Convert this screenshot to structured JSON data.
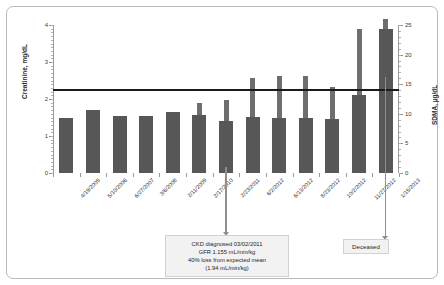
{
  "chart_data": {
    "type": "bar",
    "title": "SDMA increased 8 mo before creatinine",
    "xlabel": "",
    "ylabel": "Creatinine, mg/dL",
    "y2label": "SDMA, µg/dL",
    "ylim": [
      0,
      4
    ],
    "y2lim": [
      0,
      25
    ],
    "yticks": [
      0,
      1,
      2,
      3,
      4
    ],
    "y2ticks": [
      0,
      5,
      10,
      15,
      20,
      25
    ],
    "grid": false,
    "legend_position": "upper-left",
    "categories": [
      "4/19/2005",
      "5/10/2006",
      "6/27/2007",
      "3/6/2008",
      "2/11/2009",
      "2/17/2010",
      "2/23/2011",
      "6/2/2012",
      "6/13/2012",
      "8/23/2012",
      "10/2/2012",
      "11/27/2012",
      "1/15/2013"
    ],
    "series": [
      {
        "name": "Creatinine",
        "axis": "left",
        "unit": "mg/dL",
        "color": "#575757",
        "values": [
          1.5,
          1.7,
          1.55,
          1.54,
          1.66,
          1.56,
          1.4,
          1.52,
          1.5,
          1.5,
          1.47,
          2.1,
          3.9
        ]
      },
      {
        "name": "SDMA",
        "axis": "right",
        "unit": "µg/ dL",
        "color": "#6e6e6e",
        "values": [
          null,
          null,
          null,
          null,
          null,
          11.8,
          12.3,
          16.1,
          16.4,
          16.4,
          14.6,
          24.3,
          26.0
        ]
      }
    ],
    "reference_line": {
      "name": "upper-reference-limit",
      "axis": "right",
      "value": 14,
      "color": "#1a1a1a"
    },
    "annotations": [
      {
        "name": "ckd-diagnosis",
        "target_category": "2/23/2011",
        "lines": [
          "CKD diagnosed 03/02/2011",
          "GFR 1.155 mL/min/kg",
          "40% loss from expected mean",
          "(1.94 mL/min/kg)"
        ]
      },
      {
        "name": "deceased",
        "target_category": "1/15/2013",
        "lines": [
          "Deceased"
        ]
      }
    ]
  },
  "legend": {
    "items": [
      {
        "label": "Creatinine",
        "color": "#575757"
      },
      {
        "label": "SDMA",
        "color": "#6e6e6e"
      }
    ]
  }
}
